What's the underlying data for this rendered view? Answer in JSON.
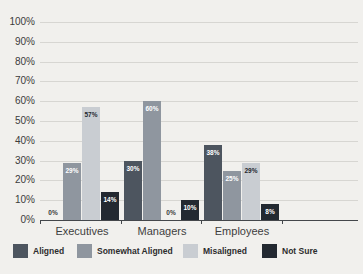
{
  "chart_data": {
    "type": "bar",
    "title": "",
    "categories": [
      "Executives",
      "Managers",
      "Employees"
    ],
    "series": [
      {
        "name": "Aligned",
        "color": "#4d555f",
        "label_color": "#ffffff",
        "values": [
          0,
          30,
          38
        ]
      },
      {
        "name": "Somewhat Aligned",
        "color": "#8f969f",
        "label_color": "#ffffff",
        "values": [
          29,
          60,
          25
        ]
      },
      {
        "name": "Misaligned",
        "color": "#c9cdd2",
        "label_color": "#24282e",
        "values": [
          57,
          0,
          29
        ]
      },
      {
        "name": "Not Sure",
        "color": "#232931",
        "label_color": "#ffffff",
        "values": [
          14,
          10,
          8
        ]
      }
    ],
    "value_suffix": "%",
    "zero_label_color": "#3b3b3b",
    "ylim": [
      0,
      100
    ],
    "grid": true,
    "legend_position": "bottom",
    "yticks": [
      {
        "value": 0,
        "label": "0%"
      },
      {
        "value": 10,
        "label": "10%"
      },
      {
        "value": 20,
        "label": "20%"
      },
      {
        "value": 30,
        "label": "30%"
      },
      {
        "value": 40,
        "label": "40%"
      },
      {
        "value": 50,
        "label": "50%"
      },
      {
        "value": 60,
        "label": "60%"
      },
      {
        "value": 70,
        "label": "70%"
      },
      {
        "value": 80,
        "label": "80%"
      },
      {
        "value": 90,
        "label": "90%"
      },
      {
        "value": 100,
        "label": "100%"
      }
    ]
  }
}
